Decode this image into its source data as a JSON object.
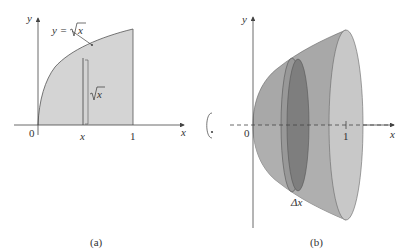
{
  "panel_a": {
    "caption": "(a)",
    "curve_label_lhs": "y = ",
    "curve_label_rad": "x",
    "strip_label_rad": "x",
    "axis_y": "y",
    "axis_x": "x",
    "tick_origin": "0",
    "tick_x": "x",
    "tick_one": "1"
  },
  "panel_b": {
    "caption": "(b)",
    "axis_y": "y",
    "axis_x": "x",
    "tick_origin": "0",
    "tick_one": "1",
    "delta_label": "Δx"
  },
  "colors": {
    "region_fill": "#d4d4d4",
    "solid_dark": "#8a8a8a",
    "solid_mid": "#a8a8a8",
    "solid_light": "#c6c6c6",
    "axis": "#444444"
  }
}
